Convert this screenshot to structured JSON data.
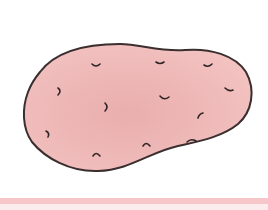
{
  "image": {
    "subject": "potato illustration",
    "alt": "Hand-drawn pink potato with small eye marks",
    "colors": {
      "background": "#ffffff",
      "potato_fill": "#efb9b8",
      "potato_shade": "#e5a9a8",
      "outline": "#3a2e2e",
      "ground_stripe": "#f6c6c9"
    },
    "eye_count": 12
  }
}
